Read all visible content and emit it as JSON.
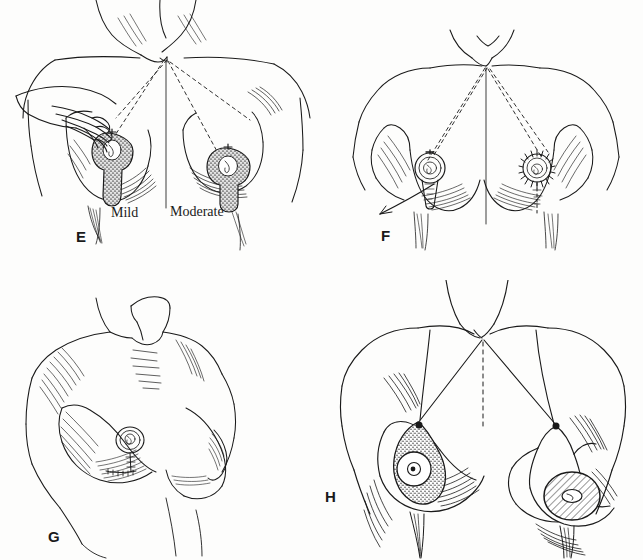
{
  "figure": {
    "type": "medical-line-illustration",
    "background_color": "#fdfdfc",
    "ink_color": "#1a1a1a",
    "width": 643,
    "height": 560,
    "layout": "2x2 panel grid"
  },
  "panels": [
    {
      "id": "E",
      "letter": "E",
      "position": "top-left",
      "description": "Frontal chest view with examiner's hand supporting the patient's right breast; dashed measurement lines descend from the sternal notch to each nipple; stippled keyhole-shaped resection markings drawn on both breasts",
      "annotations": [
        {
          "id": "mild",
          "label": "Mild"
        },
        {
          "id": "moderate",
          "label": "Moderate"
        }
      ]
    },
    {
      "id": "F",
      "letter": "F",
      "position": "top-right",
      "description": "Frontal chest view with dashed guide lines from the sternal notch to each nipple; left areola marked with a circular outline and conical vertical limb, right areola marked with a radiating sunburst pattern",
      "annotations": []
    },
    {
      "id": "G",
      "letter": "G",
      "position": "bottom-left",
      "description": "Three-quarter oblique torso view of neck, shoulders and chest with hatched shading; near breast shows a small circular nipple marking with a short vertical incision line and cross ticks below the areola",
      "annotations": []
    },
    {
      "id": "H",
      "letter": "H",
      "position": "bottom-right",
      "description": "Frontal chest view with solid lines from the sternal notch to each nipple and a dashed midline; right breast bears a stippled teardrop de-epithelialization pattern around the areola, left breast bears a cross-hatched circular areolar marking and an inverted keyhole outline",
      "annotations": []
    }
  ],
  "legend": {
    "panel_letters": [
      "E",
      "F",
      "G",
      "H"
    ],
    "text_labels": [
      "Mild",
      "Moderate"
    ]
  }
}
